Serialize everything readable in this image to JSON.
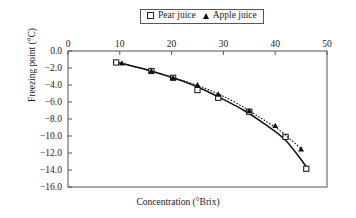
{
  "chart_data": {
    "type": "scatter",
    "title": "",
    "xlabel": "Concentration (°Brix)",
    "ylabel": "Freezing point (°C)",
    "xlim": [
      0,
      50
    ],
    "ylim": [
      -16.0,
      0.0
    ],
    "xticks": [
      "0",
      "10",
      "20",
      "30",
      "40",
      "50"
    ],
    "yticks": [
      "0.0",
      "−2.0",
      "−4.0",
      "−6.0",
      "−8.0",
      "−10.0",
      "−12.0",
      "−14.0",
      "−16.0"
    ],
    "xtick_values": [
      0,
      10,
      20,
      30,
      40,
      50
    ],
    "ytick_values": [
      0,
      -2,
      -4,
      -6,
      -8,
      -10,
      -12,
      -14,
      -16
    ],
    "x_axis_position": "top",
    "grid": false,
    "legend_position": "top-center",
    "series": [
      {
        "name": "Pear juice",
        "marker": "open-square",
        "line_style": "solid",
        "color": "#111111",
        "points": [
          {
            "x": 9.3,
            "y": -1.35
          },
          {
            "x": 16.1,
            "y": -2.35
          },
          {
            "x": 20.3,
            "y": -3.15
          },
          {
            "x": 25.0,
            "y": -4.6
          },
          {
            "x": 29.0,
            "y": -5.5
          },
          {
            "x": 35.0,
            "y": -7.15
          },
          {
            "x": 42.0,
            "y": -10.1
          },
          {
            "x": 46.0,
            "y": -13.85
          }
        ],
        "curve": [
          {
            "x": 9.3,
            "y": -1.3
          },
          {
            "x": 14,
            "y": -2.0
          },
          {
            "x": 18,
            "y": -2.7
          },
          {
            "x": 22,
            "y": -3.5
          },
          {
            "x": 26,
            "y": -4.5
          },
          {
            "x": 30,
            "y": -5.7
          },
          {
            "x": 34,
            "y": -7.0
          },
          {
            "x": 38,
            "y": -8.6
          },
          {
            "x": 42,
            "y": -10.5
          },
          {
            "x": 46,
            "y": -13.6
          }
        ]
      },
      {
        "name": "Apple juice",
        "marker": "filled-triangle",
        "line_style": "dotted",
        "color": "#111111",
        "points": [
          {
            "x": 10.4,
            "y": -1.45
          },
          {
            "x": 16.1,
            "y": -2.35
          },
          {
            "x": 20.3,
            "y": -3.15
          },
          {
            "x": 25.0,
            "y": -4.0
          },
          {
            "x": 29.0,
            "y": -5.1
          },
          {
            "x": 35.0,
            "y": -7.05
          },
          {
            "x": 40.0,
            "y": -8.8
          },
          {
            "x": 45.0,
            "y": -11.55
          }
        ],
        "curve": [
          {
            "x": 10.4,
            "y": -1.45
          },
          {
            "x": 15,
            "y": -2.2
          },
          {
            "x": 20,
            "y": -3.1
          },
          {
            "x": 25,
            "y": -4.05
          },
          {
            "x": 29,
            "y": -5.05
          },
          {
            "x": 33,
            "y": -6.3
          },
          {
            "x": 37,
            "y": -7.8
          },
          {
            "x": 41,
            "y": -9.4
          },
          {
            "x": 45,
            "y": -11.5
          }
        ]
      }
    ]
  },
  "legend": {
    "items": [
      {
        "label": "Pear juice",
        "marker": "open-square"
      },
      {
        "label": "Apple juice",
        "marker": "filled-triangle"
      }
    ]
  },
  "axes": {
    "x_title": "Concentration (°Brix)",
    "y_title": "Freezing point (°C)"
  },
  "colors": {
    "axis": "#555555",
    "series": "#111111",
    "background": "#ffffff"
  }
}
